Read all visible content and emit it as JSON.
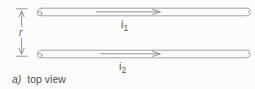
{
  "figure": {
    "caption": {
      "prefix": "a)",
      "text": "top view"
    },
    "dimension": {
      "label": "r"
    },
    "wires": [
      {
        "current": {
          "base": "i",
          "sub": "1"
        },
        "direction": "right"
      },
      {
        "current": {
          "base": "i",
          "sub": "2"
        },
        "direction": "right"
      }
    ],
    "colors": {
      "line": "#979797",
      "text": "#565656",
      "background": "#fcfcfa"
    }
  }
}
